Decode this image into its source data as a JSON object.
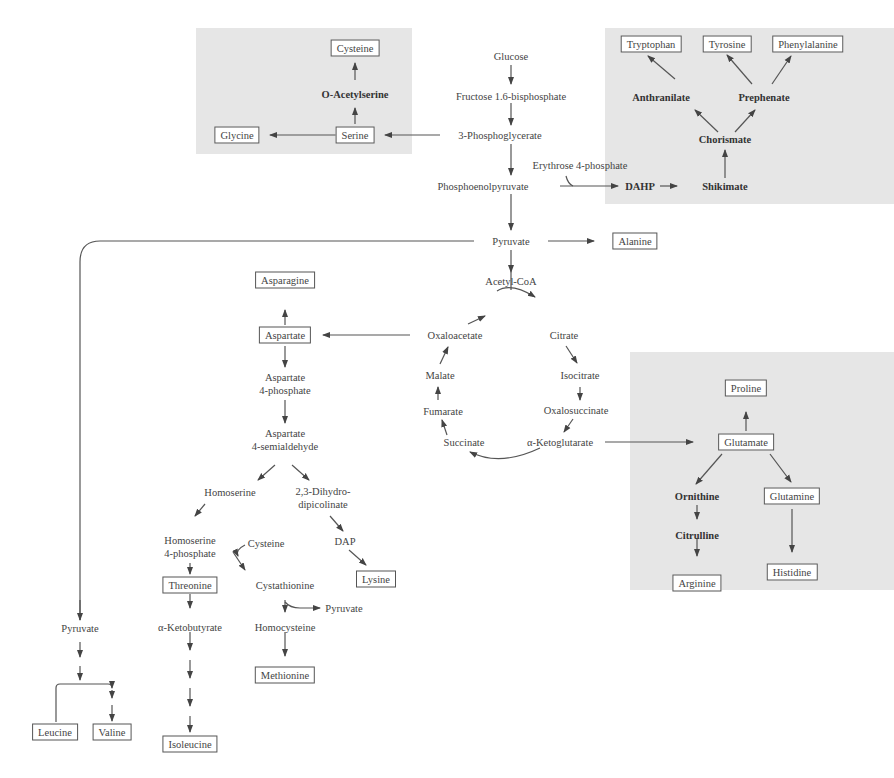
{
  "diagram": {
    "type": "metabolic-pathway",
    "panels": [
      {
        "name": "serine-family",
        "x": 196,
        "y": 28,
        "w": 216,
        "h": 126
      },
      {
        "name": "aromatic-family",
        "x": 605,
        "y": 28,
        "w": 289,
        "h": 176
      },
      {
        "name": "glutamate-family",
        "x": 630,
        "y": 352,
        "w": 264,
        "h": 238
      }
    ],
    "central": {
      "glucose": "Glucose",
      "f16bp": "Fructose 1.6-bisphosphate",
      "pg3": "3-Phosphoglycerate",
      "e4p": "Erythrose 4-phosphate",
      "pep": "Phosphoenolpyruvate",
      "pyruvate": "Pyruvate",
      "acetylcoa": "Acetyl-CoA"
    },
    "serine_family": {
      "cysteine": "Cysteine",
      "oacetylserine": "O-Acetylserine",
      "glycine": "Glycine",
      "serine": "Serine"
    },
    "aromatic_family": {
      "tryptophan": "Tryptophan",
      "tyrosine": "Tyrosine",
      "phenylalanine": "Phenylalanine",
      "anthranilate": "Anthranilate",
      "prephenate": "Prephenate",
      "chorismate": "Chorismate",
      "dahp": "DAHP",
      "shikimate": "Shikimate"
    },
    "alanine": "Alanine",
    "tca_cycle": {
      "oxaloacetate": "Oxaloacetate",
      "citrate": "Citrate",
      "isocitrate": "Isocitrate",
      "oxalosuccinate": "Oxalosuccinate",
      "aketoglutarate": "α-Ketoglutarate",
      "succinate": "Succinate",
      "fumarate": "Fumarate",
      "malate": "Malate"
    },
    "glutamate_family": {
      "proline": "Proline",
      "glutamate": "Glutamate",
      "ornithine": "Ornithine",
      "citrulline": "Citrulline",
      "arginine": "Arginine",
      "glutamine": "Glutamine",
      "histidine": "Histidine"
    },
    "aspartate_family": {
      "asparagine": "Asparagine",
      "aspartate": "Aspartate",
      "asp4p": "Aspartate\n4-phosphate",
      "asp4sa": "Aspartate\n4-semialdehyde",
      "homoserine": "Homoserine",
      "dhdp": "2,3-Dihydro-\ndipicolinate",
      "homoserine4p": "Homoserine\n4-phosphate",
      "cysteine": "Cysteine",
      "dap": "DAP",
      "threonine": "Threonine",
      "cystathionine": "Cystathionine",
      "lysine": "Lysine",
      "pyruvate_out": "Pyruvate",
      "aketobutyrate": "α-Ketobutyrate",
      "homocysteine": "Homocysteine",
      "methionine": "Methionine",
      "isoleucine": "Isoleucine"
    },
    "pyruvate_family": {
      "pyruvate": "Pyruvate",
      "leucine": "Leucine",
      "valine": "Valine"
    },
    "colors": {
      "panel": "#e6e6e6",
      "line": "#555555",
      "text": "#444444"
    }
  }
}
